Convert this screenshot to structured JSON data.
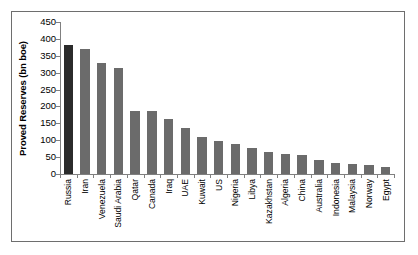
{
  "chart_data": {
    "type": "bar",
    "title": "",
    "xlabel": "",
    "ylabel": "Proved Reserves (bn boe)",
    "ylim": [
      0,
      450
    ],
    "yticks": [
      0,
      50,
      100,
      150,
      200,
      250,
      300,
      350,
      400,
      450
    ],
    "ytick_labels": [
      "0",
      "50",
      "100",
      "150",
      "200",
      "250",
      "300",
      "350",
      "400",
      "450"
    ],
    "grid": false,
    "legend": null,
    "highlight_category": "Russia",
    "colors": {
      "bar": "#6b6b6b",
      "bar_highlight": "#2b2b2b",
      "axis": "#808080",
      "frame": "#6e6e6e",
      "text": "#000000",
      "background": "#ffffff"
    },
    "categories": [
      "Russia",
      "Iran",
      "Venezuela",
      "Saudi Arabia",
      "Qatar",
      "Canada",
      "Iraq",
      "UAE",
      "Kuwait",
      "US",
      "Nigeria",
      "Libya",
      "Kazakhstan",
      "Algeria",
      "China",
      "Australia",
      "Indonesia",
      "Malaysia",
      "Norway",
      "Egypt"
    ],
    "values": [
      382,
      369,
      330,
      315,
      188,
      187,
      163,
      136,
      110,
      97,
      88,
      77,
      65,
      58,
      55,
      42,
      33,
      30,
      27,
      20
    ]
  }
}
